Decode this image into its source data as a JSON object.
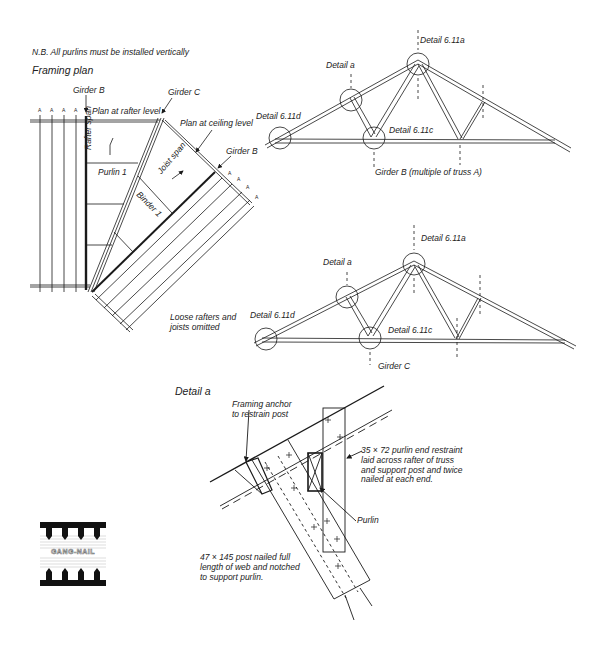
{
  "note": "N.B. All purlins must be installed vertically",
  "framing_plan": {
    "title": "Framing plan",
    "labels": {
      "girder_b_top": "Girder B",
      "girder_c": "Girder C",
      "plan_rafter": "Plan at rafter level",
      "plan_ceiling": "Plan at ceiling level",
      "girder_b_right": "Girder B",
      "rafter_span": "Rafter span",
      "joist_span": "Joist span",
      "purlin_1": "Purlin 1",
      "binder_1": "Binder 1",
      "loose_note": "Loose rafters and\njoists omitted",
      "truss_marks": "A"
    }
  },
  "truss_b": {
    "caption": "Girder B (multiple of truss A)",
    "details": {
      "apex": "Detail 6.11a",
      "detail_a": "Detail a",
      "heel": "Detail 6.11d",
      "bottom": "Detail 6.11c"
    }
  },
  "truss_c": {
    "caption": "Girder C",
    "details": {
      "apex": "Detail 6.11a",
      "detail_a": "Detail a",
      "heel": "Detail 6.11d",
      "bottom": "Detail 6.11c"
    }
  },
  "detail_a": {
    "title": "Detail a",
    "labels": {
      "anchor": "Framing anchor\nto restrain post",
      "restraint": "35 × 72 purlin end restraint\nlaid across rafter of truss\nand support post and twice\nnailed at each end.",
      "purlin": "Purlin",
      "post": "47 × 145 post nailed full\nlength of web and notched\nto support purlin."
    }
  },
  "logo": {
    "text": "GANG-NAIL"
  },
  "colors": {
    "line": "#1a1a1a",
    "background": "#ffffff",
    "dashed": "#555555"
  }
}
